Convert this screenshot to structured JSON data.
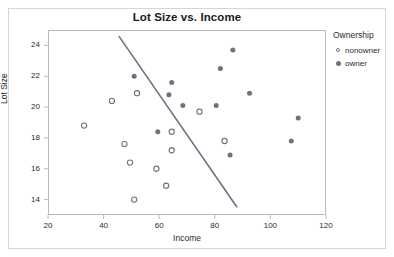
{
  "chart_data": {
    "type": "scatter",
    "title": "Lot Size vs. Income",
    "xlabel": "Income",
    "ylabel": "Lot Size",
    "xlim": [
      20,
      120
    ],
    "ylim": [
      13,
      25
    ],
    "xticks": [
      20,
      40,
      60,
      80,
      100,
      120
    ],
    "yticks": [
      14,
      16,
      18,
      20,
      22,
      24
    ],
    "grid": false,
    "legend": {
      "title": "Ownership",
      "position": "right",
      "entries": [
        {
          "name": "nonowner",
          "marker": "open-circle",
          "color": "#6f7183"
        },
        {
          "name": "owner",
          "marker": "filled-circle",
          "color": "#6f7183"
        }
      ]
    },
    "series": [
      {
        "name": "nonowner",
        "marker": "open-circle",
        "color": "#6f7183",
        "points": [
          {
            "x": 33.0,
            "y": 18.8
          },
          {
            "x": 43.0,
            "y": 20.4
          },
          {
            "x": 52.0,
            "y": 20.9
          },
          {
            "x": 47.5,
            "y": 17.6
          },
          {
            "x": 49.5,
            "y": 16.4
          },
          {
            "x": 59.0,
            "y": 16.0
          },
          {
            "x": 62.5,
            "y": 14.9
          },
          {
            "x": 51.0,
            "y": 14.0
          },
          {
            "x": 64.5,
            "y": 18.4
          },
          {
            "x": 64.5,
            "y": 17.2
          },
          {
            "x": 74.5,
            "y": 19.7
          },
          {
            "x": 83.5,
            "y": 17.8
          }
        ]
      },
      {
        "name": "owner",
        "marker": "filled-circle",
        "color": "#6f7183",
        "points": [
          {
            "x": 51.0,
            "y": 22.0
          },
          {
            "x": 63.5,
            "y": 20.8
          },
          {
            "x": 64.5,
            "y": 21.6
          },
          {
            "x": 68.5,
            "y": 20.1
          },
          {
            "x": 59.5,
            "y": 18.4
          },
          {
            "x": 80.5,
            "y": 20.1
          },
          {
            "x": 82.0,
            "y": 22.5
          },
          {
            "x": 86.5,
            "y": 23.7
          },
          {
            "x": 92.5,
            "y": 20.9
          },
          {
            "x": 85.5,
            "y": 16.9
          },
          {
            "x": 110.0,
            "y": 19.3
          },
          {
            "x": 107.5,
            "y": 17.8
          }
        ]
      }
    ],
    "annotations": [
      {
        "type": "line",
        "name": "discriminant-boundary",
        "color": "#6f7183",
        "x0": 45.5,
        "y0": 24.6,
        "x1": 88.0,
        "y1": 13.5
      }
    ]
  }
}
